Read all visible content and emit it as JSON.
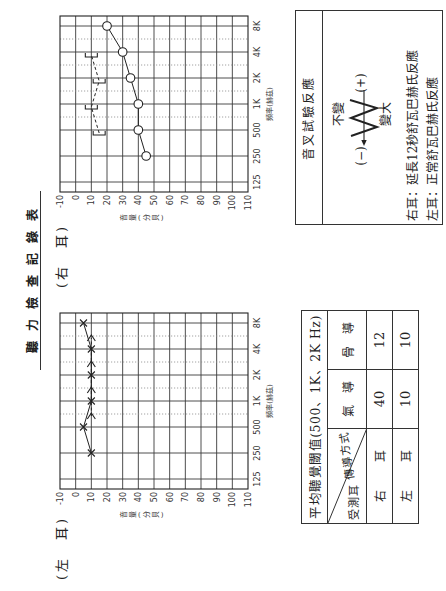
{
  "document": {
    "title": "聽力檢查記錄表"
  },
  "chart_data": [
    {
      "type": "line",
      "title": "(右　耳)",
      "xlabel": "頻率(赫茲)",
      "ylabel": "音量(分貝)",
      "x": [
        "125",
        "250",
        "500",
        "1K",
        "2K",
        "4K",
        "8K"
      ],
      "y_ticks": [
        -10,
        0,
        10,
        20,
        30,
        40,
        50,
        60,
        70,
        80,
        90,
        100,
        110
      ],
      "ylim": [
        -10,
        110
      ],
      "y_inverted": true,
      "grid": true,
      "minor_gridlines_between": [
        2,
        3,
        4,
        5
      ],
      "series": [
        {
          "id": "right-air",
          "name": "右耳 氣導",
          "marker": "O",
          "line": "solid",
          "values": [
            null,
            45,
            40,
            40,
            35,
            30,
            20
          ]
        },
        {
          "id": "right-bone",
          "name": "右耳 骨導",
          "marker": "[",
          "line": "dashed",
          "values": [
            null,
            null,
            15,
            10,
            15,
            10,
            null
          ]
        }
      ]
    },
    {
      "type": "line",
      "title": "(左　耳)",
      "xlabel": "頻率(赫茲)",
      "ylabel": "音量(分貝)",
      "x": [
        "125",
        "250",
        "500",
        "1K",
        "2K",
        "4K",
        "8K"
      ],
      "y_ticks": [
        -10,
        0,
        10,
        20,
        30,
        40,
        50,
        60,
        70,
        80,
        90,
        100,
        110
      ],
      "ylim": [
        -10,
        110
      ],
      "y_inverted": true,
      "grid": true,
      "minor_gridlines_between": [
        2,
        3,
        4,
        5
      ],
      "series": [
        {
          "id": "left-air",
          "name": "左耳 氣導",
          "marker": "X",
          "line": "solid",
          "values": [
            null,
            10,
            5,
            10,
            10,
            10,
            5
          ]
        },
        {
          "id": "left-bone",
          "name": "左耳 骨導",
          "marker": ">",
          "line": "dashed",
          "values": [
            null,
            null,
            10,
            10,
            10,
            10,
            null
          ]
        }
      ]
    }
  ],
  "average_threshold_table": {
    "title": "平均聽覺閾值(500、1K、2K Hz)",
    "corner_top": "傳導方式",
    "corner_bottom": "受測耳",
    "columns": [
      "氣　導",
      "骨　導"
    ],
    "rows": [
      {
        "ear": "右　耳",
        "air": "40",
        "bone": "12"
      },
      {
        "ear": "左　耳",
        "air": "10",
        "bone": "10"
      }
    ]
  },
  "tuning_fork": {
    "title": "音叉試驗反應",
    "unchanged": "不變",
    "louder": "變大",
    "minus": "(−)",
    "plus": "(+)",
    "notes": [
      "右耳：延長12秒舒瓦巴赫氏反應",
      "左耳：正常舒瓦巴赫氏反應"
    ]
  },
  "colors": {
    "ink": "#222222",
    "grid": "#3a3a3a",
    "minor_grid": "#8a8a8a",
    "paper": "#ffffff"
  }
}
